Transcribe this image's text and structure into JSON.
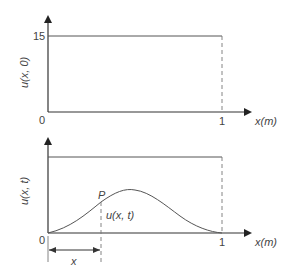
{
  "colors": {
    "axis": "#333333",
    "line": "#555555",
    "dashed": "#777777",
    "text": "#444444",
    "background": "#ffffff"
  },
  "top_plot": {
    "ylabel": "u(x, 0)",
    "y_tick_15": "15",
    "origin_label": "0",
    "x_tick_1": "1",
    "xlabel": "x(m)"
  },
  "bottom_plot": {
    "ylabel": "u(x, t)",
    "origin_label": "0",
    "x_tick_1": "1",
    "xlabel": "x(m)",
    "point_label": "P",
    "point_value_label": "u(x, t)",
    "dimension_label": "x"
  }
}
